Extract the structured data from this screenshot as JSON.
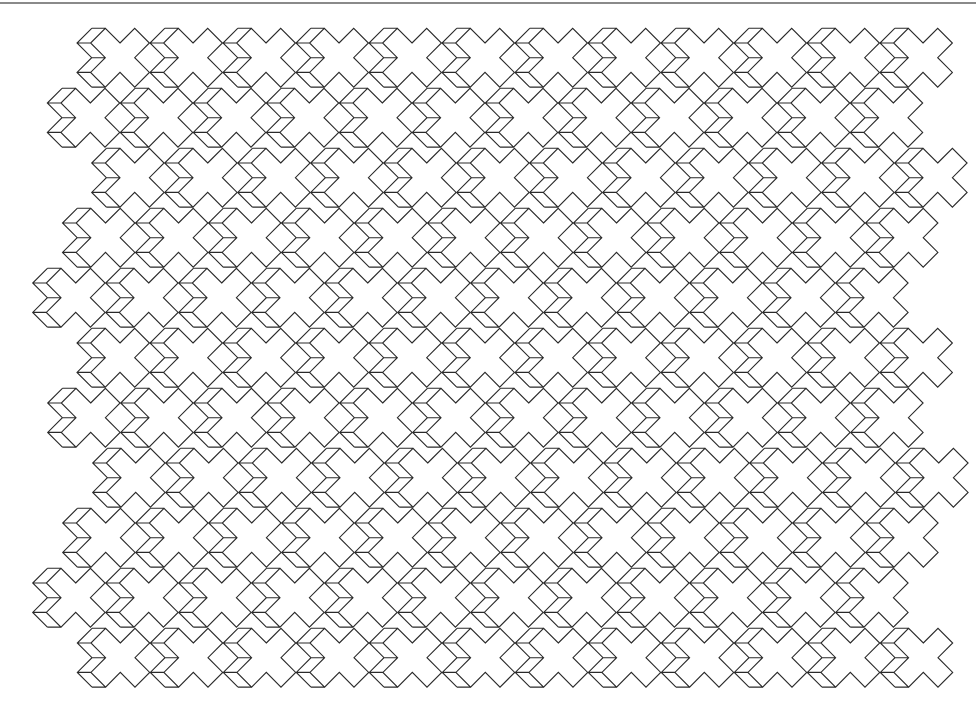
{
  "page": {
    "width": 980,
    "height": 716,
    "background": "#ffffff",
    "rule_color": "#8a8a8a",
    "stroke_color": "#2a2a2a"
  },
  "tiling": {
    "description": "Periodic tiling of X-shaped tiles, each with an extruded (shadow) copy of its left arms",
    "arm_half_width": 14.7,
    "extrusion_dx": -13.6,
    "lattice": {
      "a": [
        73,
        0
      ],
      "b": [
        -29.5,
        60
      ]
    },
    "tiles_per_row": 12,
    "rows": [
      {
        "cy": 57.7,
        "cx0": 120.0
      },
      {
        "cy": 117.7,
        "cx0": 90.3
      },
      {
        "cy": 177.7,
        "cx0": 134.7
      },
      {
        "cy": 237.7,
        "cx0": 105.5
      },
      {
        "cy": 297.7,
        "cx0": 75.7
      },
      {
        "cy": 357.7,
        "cx0": 120.0
      },
      {
        "cy": 417.7,
        "cx0": 90.7
      },
      {
        "cy": 477.7,
        "cx0": 135.7
      },
      {
        "cy": 537.7,
        "cx0": 105.7
      },
      {
        "cy": 597.7,
        "cx0": 75.7
      },
      {
        "cy": 657.7,
        "cx0": 120.3
      }
    ]
  }
}
